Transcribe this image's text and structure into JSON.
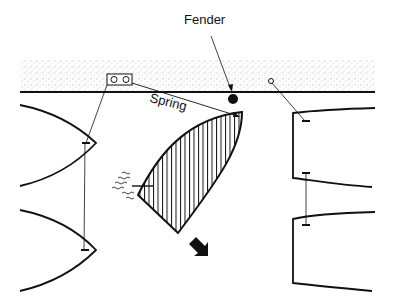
{
  "labels": {
    "fender": "Fender",
    "spring": "Spring"
  },
  "colors": {
    "ink": "#111111",
    "background": "#ffffff",
    "dock_stipple": "#555555"
  },
  "elements": {
    "dock": "stippled quay with edge line",
    "cleat": "double-ring cleat on quay",
    "bollard": "small ring on quay (right)",
    "maneuvering_boat": "hatched bow-angled boat springing off",
    "moored_boats_left": 2,
    "moored_boats_right": 2,
    "prop_wash": "wavy lines at stern",
    "direction_arrow": "black arrow pointing down-right"
  }
}
